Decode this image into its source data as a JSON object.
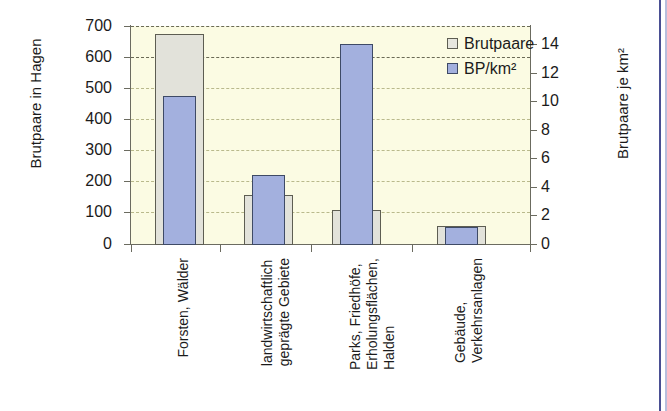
{
  "chart_data": {
    "type": "bar",
    "title": "",
    "subtitle": "",
    "categories": [
      "Forsten, Wälder",
      "landwirtschaftlich\ngeprägte Gebiete",
      "Parks, Friedhöfe,\nErholungsflächen,\nHalden",
      "Gebäude,\nVerkehrsanlagen"
    ],
    "series": [
      {
        "name": "Brutpaare",
        "axis": "left",
        "color": "#e2e2da",
        "values": [
          675,
          160,
          112,
          58
        ]
      },
      {
        "name": "BP/km²",
        "axis": "right",
        "color": "#a3b0de",
        "values": [
          10.2,
          4.8,
          14.0,
          1.2
        ]
      }
    ],
    "xlabel": "",
    "ylabel": "Brutpaare in Hagen",
    "y2label": "Brutpaare je km²",
    "ylim": [
      0,
      700
    ],
    "y2lim": [
      0,
      15.26
    ],
    "yticks": [
      0,
      100,
      200,
      300,
      400,
      500,
      600,
      700
    ],
    "y2ticks": [
      0,
      2,
      4,
      6,
      8,
      10,
      12,
      14
    ],
    "ytick_labels": [
      "0",
      "100",
      "200",
      "300",
      "400",
      "500",
      "600",
      "700"
    ],
    "y2tick_labels": [
      "0",
      "2",
      "4",
      "6",
      "8",
      "10",
      "12",
      "14"
    ],
    "grid": true,
    "legend_position": "top-right",
    "plot_background": "#fbfbe3"
  },
  "axes": {
    "left_title": "Brutpaare in Hagen",
    "right_title": "Brutpaare je km²"
  },
  "legend": {
    "items": [
      {
        "label": "Brutpaare",
        "swatch": "light-gray"
      },
      {
        "label": "BP/km²",
        "swatch": "blue"
      }
    ]
  },
  "ticks": {
    "left": [
      {
        "label": "700",
        "y": 26
      },
      {
        "label": "600",
        "y": 57
      },
      {
        "label": "500",
        "y": 88
      },
      {
        "label": "400",
        "y": 119
      },
      {
        "label": "300",
        "y": 150
      },
      {
        "label": "200",
        "y": 181
      },
      {
        "label": "100",
        "y": 212
      },
      {
        "label": "0",
        "y": 244
      }
    ],
    "right": [
      {
        "label": "14",
        "y": 44
      },
      {
        "label": "12",
        "y": 73
      },
      {
        "label": "10",
        "y": 101
      },
      {
        "label": "8",
        "y": 130
      },
      {
        "label": "6",
        "y": 158
      },
      {
        "label": "4",
        "y": 187
      },
      {
        "label": "2",
        "y": 215
      },
      {
        "label": "0",
        "y": 244
      }
    ]
  },
  "categories_render": [
    {
      "name": "Forsten, Wälder",
      "lines": [
        "Forsten, Wälder"
      ],
      "x": 175
    },
    {
      "name": "landwirtschaftlich geprägte Gebiete",
      "lines": [
        "landwirtschaftlich",
        "geprägte Gebiete"
      ],
      "x": 259
    },
    {
      "name": "Parks, Friedhöfe, Erholungsflächen, Halden",
      "lines": [
        "Parks, Friedhöfe,",
        "Erholungsflächen,",
        "Halden"
      ],
      "x": 347
    },
    {
      "name": "Gebäude, Verkehrsanlagen",
      "lines": [
        "Gebäude,",
        "Verkehrsanlagen"
      ],
      "x": 452
    }
  ],
  "bars": [
    {
      "group": 0,
      "series": "Brutpaare",
      "left": 155,
      "top": 34,
      "width": 49,
      "height": 211
    },
    {
      "group": 0,
      "series": "BP/km²",
      "left": 163,
      "top": 96,
      "width": 33,
      "height": 149
    },
    {
      "group": 1,
      "series": "Brutpaare",
      "left": 244,
      "top": 195,
      "width": 49,
      "height": 50
    },
    {
      "group": 1,
      "series": "BP/km²",
      "left": 252,
      "top": 175,
      "width": 33,
      "height": 70
    },
    {
      "group": 2,
      "series": "Brutpaare",
      "left": 332,
      "top": 210,
      "width": 49,
      "height": 35
    },
    {
      "group": 2,
      "series": "BP/km²",
      "left": 340,
      "top": 44,
      "width": 33,
      "height": 201
    },
    {
      "group": 3,
      "series": "Brutpaare",
      "left": 437,
      "top": 226,
      "width": 49,
      "height": 19
    },
    {
      "group": 3,
      "series": "BP/km²",
      "left": 445,
      "top": 227,
      "width": 33,
      "height": 18
    }
  ],
  "gridlines": [
    {
      "y": 26,
      "major": true
    },
    {
      "y": 57,
      "major": true
    },
    {
      "y": 88,
      "major": false
    },
    {
      "y": 119,
      "major": false
    },
    {
      "y": 150,
      "major": false
    },
    {
      "y": 181,
      "major": false
    },
    {
      "y": 212,
      "major": false
    }
  ],
  "xticks": [
    131,
    220,
    311,
    412,
    530
  ]
}
